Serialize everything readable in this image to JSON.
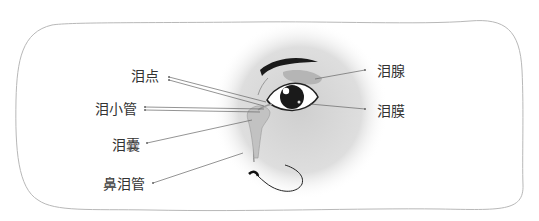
{
  "diagram": {
    "labels": {
      "lacrimal_punctum": "泪点",
      "lacrimal_canaliculus": "泪小管",
      "lacrimal_sac": "泪囊",
      "nasolacrimal_duct": "鼻泪管",
      "lacrimal_gland": "泪腺",
      "tear_film": "泪膜"
    },
    "colors": {
      "background": "#ffffff",
      "frame_stroke": "#b8b8b8",
      "halo": "#d6d6d6",
      "eyebrow": "#1a1a1a",
      "gland": "#b5b5b5",
      "leader_line": "#666666",
      "text": "#333333"
    }
  }
}
